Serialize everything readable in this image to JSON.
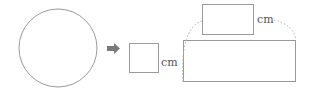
{
  "diagram": {
    "labels": {
      "small_square_unit": "cm",
      "top_rect_unit": "cm"
    },
    "colors": {
      "stroke": "#9a9a9a",
      "arrow": "#7a7a7a",
      "dotted": "#b0b0b0"
    }
  }
}
